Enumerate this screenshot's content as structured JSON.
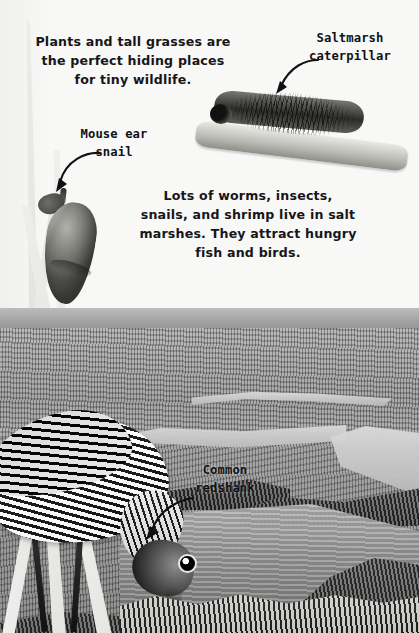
{
  "page": {
    "background_color": "#f8f8f6",
    "text_color": "#16161a"
  },
  "intro_text": "Plants and tall grasses are the perfect hiding places for tiny wildlife.",
  "middle_text": "Lots of worms, insects, snails, and shrimp live in salt marshes. They attract hungry fish and birds.",
  "labels": {
    "caterpillar": "Saltmarsh caterpillar",
    "snail": "Mouse ear snail",
    "redshank": "Common redshank"
  },
  "photos": [
    {
      "name": "saltmarsh-caterpillar-photo",
      "subject": "hairy caterpillar on a twig"
    },
    {
      "name": "mouse-ear-snail-photo",
      "subject": "snail climbing a grass stem"
    },
    {
      "name": "salt-marsh-landscape-photo",
      "subject": "tidal salt marsh with creeks"
    },
    {
      "name": "common-redshank-photo",
      "subject": "wading bird feeding at the water edge"
    }
  ]
}
